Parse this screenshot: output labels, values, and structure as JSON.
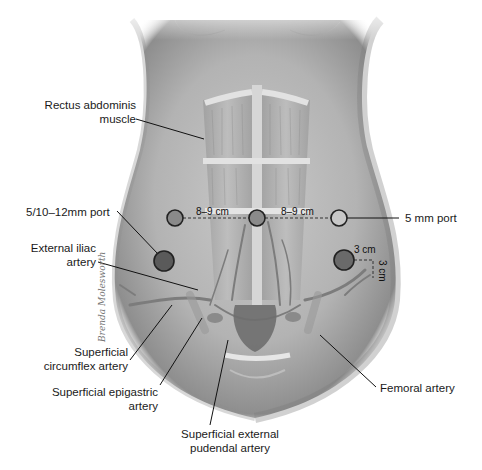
{
  "figure": {
    "type": "anatomical illustration"
  },
  "labels": {
    "rectus": [
      "Rectus abdominis",
      "muscle"
    ],
    "port_left": "5/10–12mm port",
    "ext_iliac": [
      "External iliac",
      "artery"
    ],
    "sup_circumflex": [
      "Superficial",
      "circumflex artery"
    ],
    "sup_epigastric": [
      "Superficial epigastric",
      "artery"
    ],
    "sup_ext_pudendal": [
      "Superficial external",
      "pudendal artery"
    ],
    "port_right": "5 mm port",
    "femoral": "Femoral artery"
  },
  "measurements": {
    "left_spacing": "8–9 cm",
    "right_spacing": "8–9 cm",
    "lower_right_horizontal": "3 cm",
    "lower_right_vertical": "3 cm"
  },
  "ports": [
    {
      "name": "left-upper-port",
      "cx": 175,
      "cy": 218,
      "r": 8,
      "fill": "#8a8a8a"
    },
    {
      "name": "umbilical-port",
      "cx": 257,
      "cy": 218,
      "r": 8,
      "fill": "#8a8a8a"
    },
    {
      "name": "right-upper-port",
      "cx": 339,
      "cy": 218,
      "r": 8,
      "fill": "#c8c8c8"
    },
    {
      "name": "left-lower-port",
      "cx": 164,
      "cy": 261,
      "r": 10,
      "fill": "#5a5a5a"
    },
    {
      "name": "right-lower-port",
      "cx": 344,
      "cy": 260,
      "r": 10,
      "fill": "#6a6a6a"
    }
  ],
  "signature": "Brenda Molesworth",
  "colors": {
    "skin_base": "#b9b9b9",
    "skin_shadow": "#8f8f8f",
    "muscle": "#a8a8a8",
    "vessel": "#7c7c7c",
    "leader": "#111111"
  }
}
